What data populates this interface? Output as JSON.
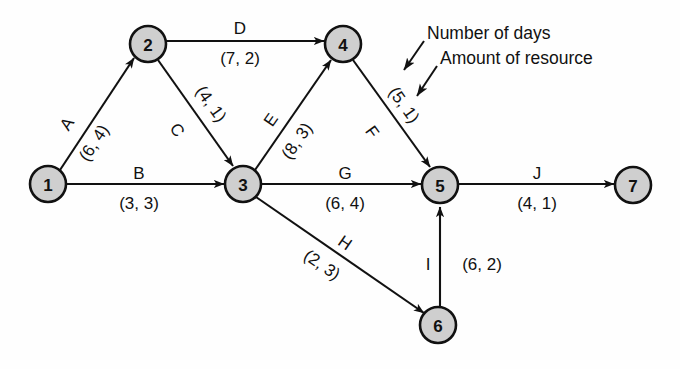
{
  "diagram": {
    "node_fill": "#cfcfcf",
    "stroke": "#111111",
    "nodes": [
      {
        "id": "1",
        "label": "1",
        "cx": 48,
        "cy": 184
      },
      {
        "id": "2",
        "label": "2",
        "cx": 148,
        "cy": 44
      },
      {
        "id": "3",
        "label": "3",
        "cx": 243,
        "cy": 184
      },
      {
        "id": "4",
        "label": "4",
        "cx": 343,
        "cy": 44
      },
      {
        "id": "5",
        "label": "5",
        "cx": 440,
        "cy": 185
      },
      {
        "id": "6",
        "label": "6",
        "cx": 438,
        "cy": 325
      },
      {
        "id": "7",
        "label": "7",
        "cx": 633,
        "cy": 185
      }
    ],
    "edges": [
      {
        "id": "A",
        "from": "1",
        "to": "2",
        "name": "A",
        "weight": "(6, 4)",
        "days": 6,
        "resource": 4
      },
      {
        "id": "B",
        "from": "1",
        "to": "3",
        "name": "B",
        "weight": "(3, 3)",
        "days": 3,
        "resource": 3
      },
      {
        "id": "C",
        "from": "2",
        "to": "3",
        "name": "C",
        "weight": "(4, 1)",
        "days": 4,
        "resource": 1
      },
      {
        "id": "D",
        "from": "2",
        "to": "4",
        "name": "D",
        "weight": "(7, 2)",
        "days": 7,
        "resource": 2
      },
      {
        "id": "E",
        "from": "3",
        "to": "4",
        "name": "E",
        "weight": "(8, 3)",
        "days": 8,
        "resource": 3
      },
      {
        "id": "F",
        "from": "4",
        "to": "5",
        "name": "F",
        "weight": "(5, 1)",
        "days": 5,
        "resource": 1
      },
      {
        "id": "G",
        "from": "3",
        "to": "5",
        "name": "G",
        "weight": "(6, 4)",
        "days": 6,
        "resource": 4
      },
      {
        "id": "H",
        "from": "3",
        "to": "6",
        "name": "H",
        "weight": "(2, 3)",
        "days": 2,
        "resource": 3
      },
      {
        "id": "I",
        "from": "6",
        "to": "5",
        "name": "I",
        "weight": "(6, 2)",
        "days": 6,
        "resource": 2
      },
      {
        "id": "J",
        "from": "5",
        "to": "7",
        "name": "J",
        "weight": "(4, 1)",
        "days": 4,
        "resource": 1
      }
    ],
    "annotations": [
      {
        "id": "days",
        "text": "Number of days",
        "x": 427,
        "y": 33,
        "points_to": "first value of (5, 1)"
      },
      {
        "id": "resource",
        "text": "Amount of resource",
        "x": 440,
        "y": 58,
        "points_to": "second value of (5, 1)"
      }
    ]
  }
}
